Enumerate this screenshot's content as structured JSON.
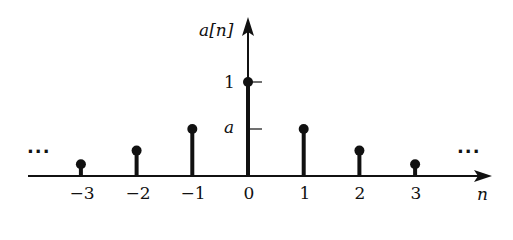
{
  "chart_data": {
    "type": "stem",
    "title": "",
    "xlabel": "n",
    "ylabel": "a[n]",
    "x": [
      -3,
      -2,
      -1,
      0,
      1,
      2,
      3
    ],
    "values": [
      0.125,
      0.27,
      0.5,
      1,
      0.5,
      0.27,
      0.125
    ],
    "y_ticks": [
      {
        "value": 1,
        "label": "1"
      },
      {
        "value": 0.5,
        "label": "a"
      }
    ],
    "x_tick_labels": [
      "−3",
      "−2",
      "−1",
      "0",
      "1",
      "2",
      "3"
    ],
    "annotations": [
      "...",
      "..."
    ],
    "grid": false,
    "color": "#111111"
  },
  "labels": {
    "y_axis": "a[n]",
    "x_axis": "n",
    "tick_one": "1",
    "tick_a": "a",
    "ellipsis_left": "···",
    "ellipsis_right": "···"
  }
}
